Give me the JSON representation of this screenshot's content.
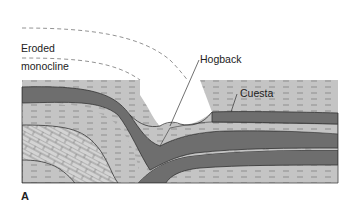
{
  "figure": {
    "panel_label": "A",
    "labels": {
      "eroded": "Eroded",
      "monocline": "monocline",
      "hogback": "Hogback",
      "cuesta": "Cuesta"
    }
  },
  "colors": {
    "background": "#ffffff",
    "dark_layer": "#6e6e6e",
    "light_layer": "#c4c4c4",
    "limestone": "#d2d2d2",
    "dash_marks": "#808080",
    "outline": "#333333",
    "eroded_outline": "#777777"
  }
}
